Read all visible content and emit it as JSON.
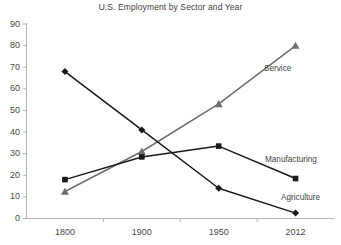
{
  "chart_data": {
    "type": "line",
    "title": "U.S. Employment by Sector and Year",
    "xlabel": "",
    "ylabel": "",
    "categories": [
      "1800",
      "1900",
      "1950",
      "2012"
    ],
    "x": [
      1800,
      1900,
      1950,
      2012
    ],
    "ylim": [
      0,
      90
    ],
    "ytick_labels": [
      "90",
      "80",
      "70",
      "60",
      "50",
      "40",
      "30",
      "20",
      "10",
      "0"
    ],
    "yticks": [
      90,
      80,
      70,
      60,
      50,
      40,
      30,
      20,
      10,
      0
    ],
    "grid": false,
    "legend_position": "inline-right",
    "series": [
      {
        "name": "Agriculture",
        "values": [
          68,
          41,
          14,
          2.5
        ],
        "color": "#1a1a1a",
        "marker": "diamond",
        "label": "Agriculture"
      },
      {
        "name": "Manufacturing",
        "values": [
          18,
          28.5,
          33.5,
          18.5
        ],
        "color": "#1a1a1a",
        "marker": "square",
        "label": "Manufacturing"
      },
      {
        "name": "Service",
        "values": [
          12.5,
          31,
          53,
          80
        ],
        "color": "#6e6e6e",
        "marker": "triangle",
        "label": "Service"
      }
    ],
    "annotations": [
      {
        "text": "Service",
        "series": "Service"
      },
      {
        "text": "Manufacturing",
        "series": "Manufacturing"
      },
      {
        "text": "Agriculture",
        "series": "Agriculture"
      }
    ],
    "axis_color": "#b4b4b4"
  }
}
